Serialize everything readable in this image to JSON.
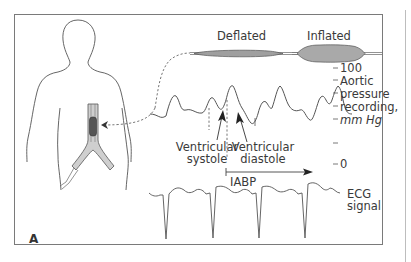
{
  "figure": {
    "panel_label": "A",
    "balloon": {
      "deflated_label": "Deflated",
      "inflated_label": "Inflated",
      "fill_color": "#a9a9a9"
    },
    "aortic_scale": {
      "top_tick": "100",
      "bottom_tick": "0",
      "label_lines": [
        "Aortic",
        "pressure",
        "recording,",
        "mm Hg"
      ]
    },
    "annotations": {
      "systole_lines": [
        "Ventricular",
        "systole"
      ],
      "diastole_lines": [
        "Ventricular",
        "diastole"
      ],
      "iabp_label": "IABP"
    },
    "ecg": {
      "label_lines": [
        "ECG",
        "signal"
      ]
    },
    "colors": {
      "line": "#4a4a4a",
      "frame": "#7a7a7a",
      "catheter_fill": "#9a9a9a",
      "balloon_dark": "#555555"
    }
  }
}
